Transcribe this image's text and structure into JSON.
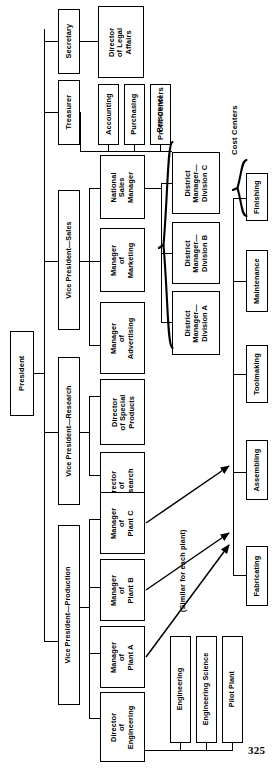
{
  "document": {
    "kind": "organization-chart",
    "orientation": "rotated-90-counterclockwise",
    "page_number": "325"
  },
  "boxes": {
    "president": "President",
    "secretary": "Secretary",
    "treasurer": "Treasurer",
    "director_legal_affairs": "Director\nof Legal\nAffairs",
    "accounting": "Accounting",
    "purchasing": "Purchasing",
    "personnel": "Personnel",
    "vp_sales": "Vice President—Sales",
    "national_sales_manager": "National\nSales\nManager",
    "manager_of_marketing": "Manager\nof\nMarketing",
    "manager_of_advertising": "Manager\nof\nAdvertising",
    "district_manager_division_c": "District\nManager—\nDivision C",
    "district_manager_division_b": "District\nManager—\nDivision B",
    "district_manager_division_a": "District\nManager—\nDivision A",
    "vp_research": "Vice President—Research",
    "director_special_products": "Director\nof Special\nProducts",
    "director_research": "Director\nof\nResearch",
    "vp_production": "Vice President—Production",
    "manager_plant_c": "Manager\nof\nPlant C",
    "manager_plant_b": "Manager\nof\nPlant B",
    "manager_plant_a": "Manager\nof\nPlant A",
    "director_engineering": "Director\nof\nEngineering",
    "engineering": "Engineering",
    "engineering_science": "Engineering Science",
    "pilot_plant": "Pilot Plant",
    "finishing": "Finishing",
    "maintenance": "Maintenance",
    "toolmaking": "Toolmaking",
    "assembling": "Assembling",
    "fabricating": "Fabricating"
  },
  "annotations": {
    "profit_centers": "Profit Centers",
    "cost_centers": "Cost Centers",
    "similar_for_each_plant": "(Similar for each plant)"
  },
  "colors": {
    "line": "#000000",
    "box_fill": "#ffffff",
    "text": "#000000",
    "background": "#ffffff"
  }
}
